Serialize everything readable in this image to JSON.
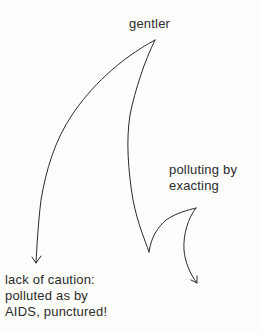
{
  "diagram": {
    "type": "hand-drawn branching curve diagram",
    "stroke_color": "#2a2a2a",
    "background_color": "#fdfdfb",
    "nodes": {
      "top": {
        "label": "gentler"
      },
      "right": {
        "lines": [
          "polluting by",
          "exacting"
        ]
      },
      "bottom_left": {
        "lines": [
          "lack of caution:",
          "polluted as by",
          "AIDS, punctured!"
        ]
      }
    },
    "edges": [
      {
        "from": "gentler",
        "to": "lack of caution: polluted as by AIDS, punctured!",
        "style": "curved arrow"
      },
      {
        "from": "gentler",
        "to": "polluting by exacting",
        "style": "curved line with cusp, then arrow downward"
      }
    ]
  }
}
